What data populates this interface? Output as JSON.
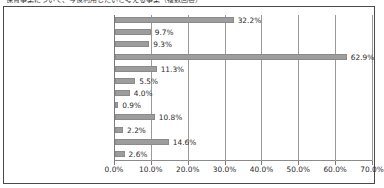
{
  "clipped_title": "保育事業について、今後利用したいと考える事業（複数回答）",
  "chart_data": {
    "type": "bar",
    "orientation": "horizontal",
    "title": "",
    "xlabel": "",
    "ylabel": "",
    "xlim": [
      0,
      70
    ],
    "grid": true,
    "legend": false,
    "unit": "%",
    "xticks": [
      "0.0%",
      "10.0%",
      "20.0%",
      "30.0%",
      "40.0%",
      "50.0%",
      "60.0%",
      "70.0%"
    ],
    "xtick_values": [
      0,
      10,
      20,
      30,
      40,
      50,
      60,
      70
    ],
    "categories": [
      "認可保育園",
      "幼稚園",
      "幼稚園の預かり保育",
      "認定こども園",
      "事業所内保育施設",
      "家庭的保育",
      "居宅訪問型保育",
      "その他の認可外の保育施設",
      "ファミリー・サポート・センター",
      "その他",
      "特に利用したい事業はない",
      "無回答"
    ],
    "values": [
      32.2,
      9.7,
      9.3,
      62.9,
      11.3,
      5.5,
      4.0,
      0.9,
      10.8,
      2.2,
      14.6,
      2.6
    ],
    "value_labels": [
      "32.2%",
      "9.7%",
      "9.3%",
      "62.9%",
      "11.3%",
      "5.5%",
      "4.0%",
      "0.9%",
      "10.8%",
      "2.2%",
      "14.6%",
      "2.6%"
    ],
    "colors": {
      "bar_fill": "#9d9d9d",
      "bar_border": "#8a8a8a",
      "gridline": "#9a9a9a",
      "frame": "#4a4a4a",
      "text": "#1d1d1d"
    }
  }
}
